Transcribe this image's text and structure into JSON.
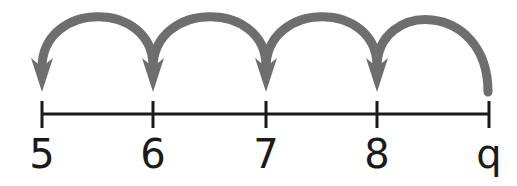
{
  "diagram": {
    "type": "number-line-jumps",
    "ticks": [
      {
        "value": "5",
        "x": 42
      },
      {
        "value": "6",
        "x": 153
      },
      {
        "value": "7",
        "x": 266
      },
      {
        "value": "8",
        "x": 377
      },
      {
        "value": "9",
        "x": 489,
        "display": "q"
      }
    ],
    "labels": [
      "5",
      "6",
      "7",
      "8",
      "q"
    ],
    "jumps": [
      {
        "from": "9",
        "to": "8"
      },
      {
        "from": "8",
        "to": "7"
      },
      {
        "from": "7",
        "to": "6"
      },
      {
        "from": "6",
        "to": "5"
      }
    ],
    "colors": {
      "line": "#1a1a1a",
      "arrow": "#6e6e6e"
    }
  }
}
